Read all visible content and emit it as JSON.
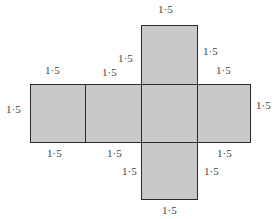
{
  "diagram": {
    "type": "cube-net",
    "face_color": "#c9c9c9",
    "edge_color": "#2a2a2a",
    "faces": [
      {
        "id": "top",
        "x": 141,
        "y": 25,
        "w": 56,
        "h": 59
      },
      {
        "id": "left-end",
        "x": 30,
        "y": 84,
        "w": 56,
        "h": 58
      },
      {
        "id": "left",
        "x": 85,
        "y": 84,
        "w": 57,
        "h": 58
      },
      {
        "id": "center",
        "x": 141,
        "y": 84,
        "w": 57,
        "h": 58
      },
      {
        "id": "right",
        "x": 197,
        "y": 84,
        "w": 54,
        "h": 58
      },
      {
        "id": "bottom",
        "x": 141,
        "y": 141,
        "w": 57,
        "h": 58
      }
    ],
    "labels": [
      {
        "text": "1·5",
        "x": 158,
        "y": 4
      },
      {
        "text": "1·5",
        "x": 118,
        "y": 53
      },
      {
        "text": "1·5",
        "x": 203,
        "y": 46
      },
      {
        "text": "1·5",
        "x": 45,
        "y": 65
      },
      {
        "text": "1·5",
        "x": 102,
        "y": 67
      },
      {
        "text": "1·5",
        "x": 216,
        "y": 65
      },
      {
        "text": "1·5",
        "x": 6,
        "y": 104
      },
      {
        "text": "1·5",
        "x": 256,
        "y": 100
      },
      {
        "text": "1·5",
        "x": 47,
        "y": 148
      },
      {
        "text": "1·5",
        "x": 107,
        "y": 148
      },
      {
        "text": "1·5",
        "x": 217,
        "y": 148
      },
      {
        "text": "1·5",
        "x": 122,
        "y": 166
      },
      {
        "text": "1·5",
        "x": 204,
        "y": 166
      },
      {
        "text": "1·5",
        "x": 162,
        "y": 205
      }
    ]
  }
}
